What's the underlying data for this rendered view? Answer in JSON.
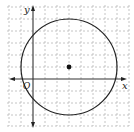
{
  "figure": {
    "type": "coordinate-plane-circle",
    "axes": {
      "x_label": "x",
      "y_label": "y",
      "origin_label": "O"
    },
    "grid": {
      "style": "dashed",
      "unit_px": 12
    },
    "circle": {
      "center": [
        3,
        1
      ],
      "radius": 4
    },
    "center_point": {
      "marked": true
    },
    "colors": {
      "grid": "#b5b5b5",
      "axis": "#333333",
      "circle": "#222222"
    }
  }
}
